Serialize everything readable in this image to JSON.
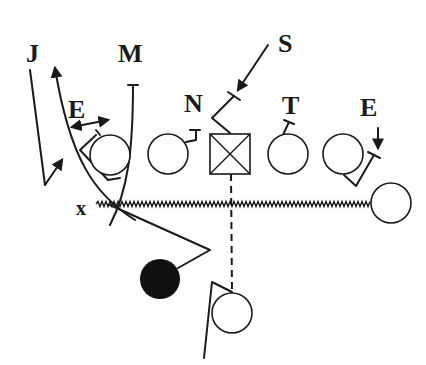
{
  "diagram": {
    "type": "football-play",
    "colors": {
      "ink": "#1a1a1a",
      "background": "#ffffff",
      "ball_carrier": "#111111"
    },
    "defenders": [
      {
        "id": "J",
        "label": "J"
      },
      {
        "id": "M",
        "label": "M"
      },
      {
        "id": "S",
        "label": "S"
      },
      {
        "id": "N",
        "label": "N"
      },
      {
        "id": "T",
        "label": "T"
      },
      {
        "id": "E_left",
        "label": "E"
      },
      {
        "id": "E_right",
        "label": "E"
      }
    ],
    "offense": {
      "split_end_label": "x",
      "center_symbol": "boxed-x",
      "linemen_count": 4,
      "flanker": "circle",
      "ball_carrier": "filled-circle",
      "back": "circle"
    },
    "routes": [
      {
        "name": "motion",
        "style": "zigzag"
      },
      {
        "name": "snap-path",
        "style": "dashed"
      }
    ]
  }
}
